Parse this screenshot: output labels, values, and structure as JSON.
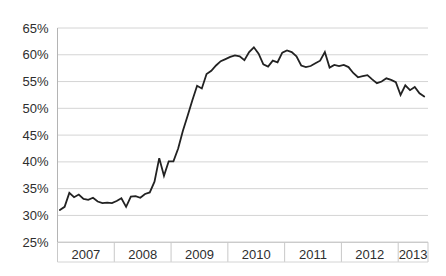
{
  "chart_data": {
    "type": "line",
    "title": "",
    "xlabel": "",
    "ylabel": "",
    "legend": "none",
    "grid": "horizontal",
    "ylim": [
      25,
      65
    ],
    "y_tick_step": 5,
    "y_tick_labels": [
      "65%",
      "60%",
      "55%",
      "50%",
      "45%",
      "40%",
      "35%",
      "30%",
      "25%"
    ],
    "x_year_labels": [
      "2007",
      "2008",
      "2009",
      "2010",
      "2011",
      "2012",
      "2013"
    ],
    "x_frequency": "monthly",
    "x_start": "2007-01",
    "x_end": "2013-06",
    "series": [
      {
        "name": "value",
        "unit": "%",
        "values": [
          31.0,
          31.6,
          34.2,
          33.4,
          33.9,
          33.1,
          32.9,
          33.3,
          32.6,
          32.3,
          32.4,
          32.3,
          32.7,
          33.2,
          31.6,
          33.5,
          33.6,
          33.3,
          34.0,
          34.3,
          36.3,
          40.7,
          37.4,
          40.1,
          40.1,
          42.5,
          45.8,
          48.6,
          51.5,
          54.2,
          53.7,
          56.4,
          57.0,
          58.0,
          58.8,
          59.2,
          59.6,
          59.9,
          59.7,
          59.0,
          60.5,
          61.4,
          60.2,
          58.2,
          57.8,
          58.9,
          58.6,
          60.4,
          60.8,
          60.5,
          59.7,
          58.0,
          57.7,
          57.9,
          58.4,
          58.9,
          60.5,
          57.6,
          58.1,
          57.9,
          58.1,
          57.7,
          56.6,
          55.8,
          56.0,
          56.2,
          55.4,
          54.7,
          55.0,
          55.6,
          55.3,
          54.9,
          52.5,
          54.3,
          53.4,
          54.0,
          52.8,
          52.2
        ]
      }
    ],
    "colors": {
      "line": "#222222",
      "gridline": "#d4d4d4",
      "axis": "#b4b4b4",
      "tick_strip": "#c9c9c9",
      "text": "#2e2e2e",
      "background": "#ffffff"
    }
  }
}
